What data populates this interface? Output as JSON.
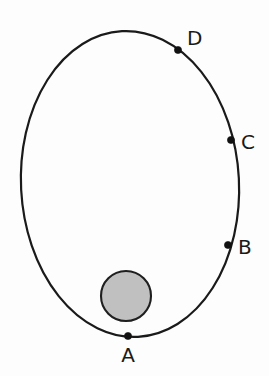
{
  "figure": {
    "canvas": {
      "width": 269,
      "height": 376,
      "background": "#fdfdfd"
    },
    "orbit": {
      "name": "elliptical-orbit",
      "center_x": 130,
      "center_y": 184,
      "radius_x": 109,
      "radius_y": 153,
      "rotation_deg": -3,
      "stroke_color": "#1a1a1a",
      "stroke_width": 2.2,
      "fill": "none"
    },
    "central_body": {
      "name": "central-body",
      "center_x": 126,
      "center_y": 296,
      "radius": 25,
      "fill_color": "#c0c0c0",
      "stroke_color": "#1f1f1f",
      "stroke_width": 2.1
    },
    "points": [
      {
        "id": "A",
        "label": "A",
        "marker_x": 128,
        "marker_y": 336,
        "marker_radius": 3.6,
        "label_x": 128,
        "label_y": 362,
        "label_anchor": "middle",
        "position_note": "bottom of ellipse, perihelion nearest central body"
      },
      {
        "id": "B",
        "label": "B",
        "marker_x": 228,
        "marker_y": 245,
        "marker_radius": 3.6,
        "label_x": 238,
        "label_y": 254,
        "label_anchor": "start",
        "position_note": "lower right of ellipse"
      },
      {
        "id": "C",
        "label": "C",
        "marker_x": 231,
        "marker_y": 140,
        "marker_radius": 3.6,
        "label_x": 241,
        "label_y": 149,
        "label_anchor": "start",
        "position_note": "right of ellipse"
      },
      {
        "id": "D",
        "label": "D",
        "marker_x": 178,
        "marker_y": 50,
        "marker_radius": 3.6,
        "label_x": 187,
        "label_y": 45,
        "label_anchor": "start",
        "position_note": "upper right of ellipse"
      }
    ],
    "colors": {
      "background": "#fdfdfd",
      "stroke": "#1a1a1a",
      "body_fill": "#c0c0c0",
      "marker": "#111111",
      "label_text": "#1a1a1a"
    }
  }
}
